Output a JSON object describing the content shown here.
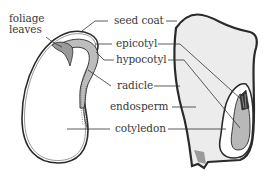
{
  "diagram": {
    "seeds": [
      {
        "name": "dicot-seed",
        "position": "left"
      },
      {
        "name": "monocot-seed",
        "position": "right"
      }
    ],
    "labels": {
      "foliage_leaves_line1": "foliage",
      "foliage_leaves_line2": "leaves",
      "seed_coat": "seed coat",
      "epicotyl": "epicotyl",
      "hypocotyl": "hypocotyl",
      "radicle": "radicle",
      "endosperm": "endosperm",
      "cotyledon": "cotyledon"
    },
    "colors": {
      "outline": "#2a2a2a",
      "seed_fill": "#ececec",
      "embryo_fill": "#b8b8b8",
      "label_text": "#3a3a3a",
      "leader_line": "#333333"
    }
  }
}
